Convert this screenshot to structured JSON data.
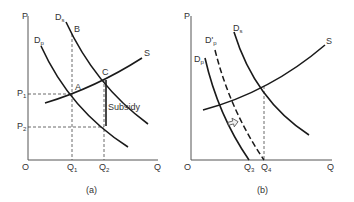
{
  "figure": {
    "panels": [
      {
        "id": "a",
        "caption": "(a)",
        "axes": {
          "y_label": "P",
          "x_label": "Q",
          "origin_label": "O"
        },
        "curves": {
          "supply": {
            "label": "S"
          },
          "demand_social": {
            "label": "D",
            "sub": "s"
          },
          "demand_private": {
            "label": "D",
            "sub": "p"
          }
        },
        "points": {
          "A": "A",
          "B": "B",
          "C": "C"
        },
        "price_labels": {
          "p1": "P",
          "p1_sub": "1",
          "p2": "P",
          "p2_sub": "2"
        },
        "quantity_labels": {
          "q1": "Q",
          "q1_sub": "1",
          "q2": "Q",
          "q2_sub": "2"
        },
        "annotation": "Subsidy"
      },
      {
        "id": "b",
        "caption": "(b)",
        "axes": {
          "y_label": "P",
          "x_label": "Q",
          "origin_label": "O"
        },
        "curves": {
          "supply": {
            "label": "S"
          },
          "demand_social": {
            "label": "D",
            "sub": "s"
          },
          "demand_private": {
            "label": "D",
            "sub": "p"
          },
          "demand_private_shifted": {
            "label": "D'",
            "sub": "p"
          }
        },
        "quantity_labels": {
          "q3": "Q",
          "q3_sub": "3",
          "q4": "Q",
          "q4_sub": "4"
        },
        "shift_arrow": "right-arrow"
      }
    ],
    "colors": {
      "line": "#1a1a1a",
      "axis": "#555555",
      "dashed": "#444444",
      "text": "#333333"
    }
  }
}
